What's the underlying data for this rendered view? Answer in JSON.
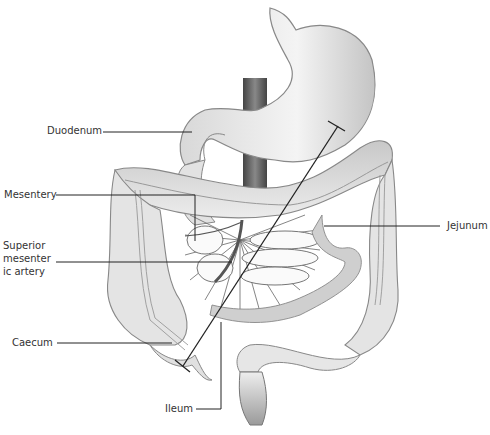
{
  "diagram": {
    "type": "anatomical-illustration",
    "labels": [
      {
        "id": "duodenum",
        "text": "Duodenum",
        "side": "left"
      },
      {
        "id": "mesentery",
        "text": "Mesentery",
        "side": "left"
      },
      {
        "id": "superior-mesenteric-artery",
        "text": "Superior\nmesenter\nic artery",
        "side": "left"
      },
      {
        "id": "caecum",
        "text": "Caecum",
        "side": "left"
      },
      {
        "id": "ileum",
        "text": "Ileum",
        "side": "bottom"
      },
      {
        "id": "jejunum",
        "text": "Jejunum",
        "side": "right"
      }
    ],
    "colors": {
      "organ_fill": "#e6e6e6",
      "organ_shade": "#b8b8b8",
      "outline": "#777777",
      "leader_line": "#222222",
      "aorta": "#5a5a5a",
      "label_text": "#333333"
    }
  }
}
